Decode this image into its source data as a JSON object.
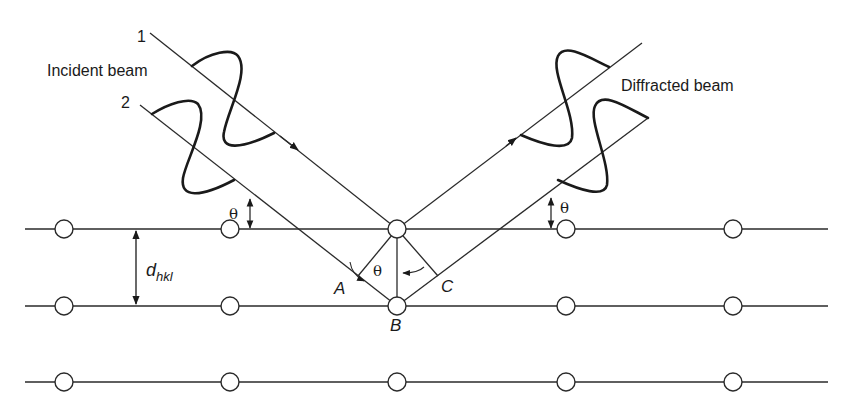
{
  "labels": {
    "incident_beam": "Incident beam",
    "diffracted_beam": "Diffracted beam",
    "ray1": "1",
    "ray2": "2",
    "theta": "θ",
    "d": "d",
    "d_sub": "hkl",
    "point_a": "A",
    "point_b": "B",
    "point_c": "C"
  },
  "lattice": {
    "rows_y": [
      229,
      306,
      382
    ],
    "atoms_x": [
      64,
      230,
      397,
      566,
      733
    ],
    "line_x_start": 25,
    "line_x_end": 828,
    "atom_radius": 9
  },
  "colors": {
    "line": "#2a2a2a",
    "wave": "#1a1a1a",
    "background": "#ffffff"
  }
}
